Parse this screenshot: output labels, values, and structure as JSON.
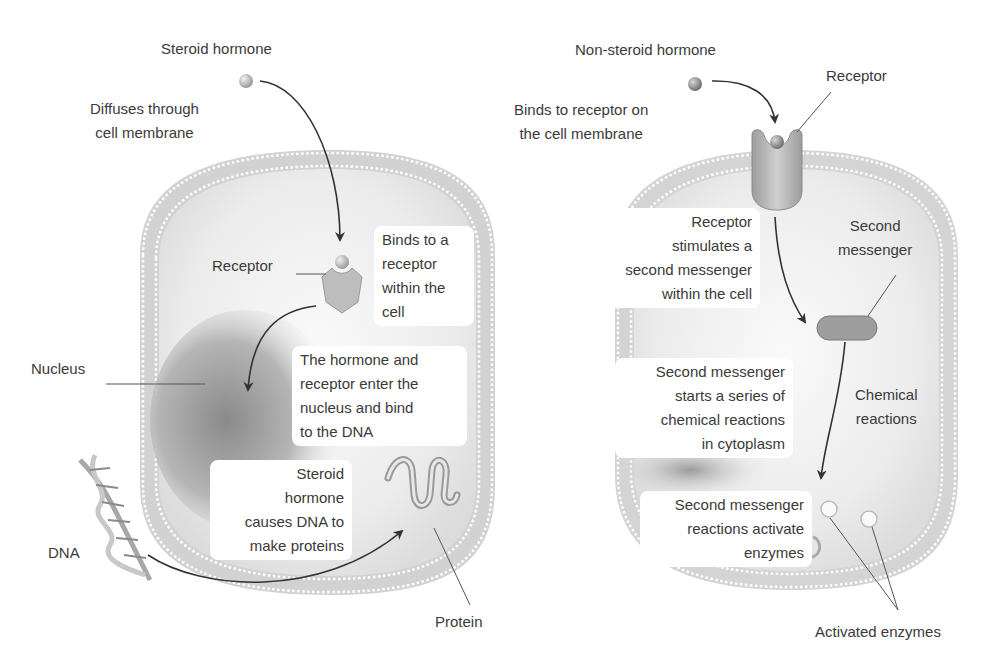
{
  "steroid_panel": {
    "title": "Steroid hormone",
    "step1": [
      "Diffuses through",
      "cell membrane"
    ],
    "receptor_label": "Receptor",
    "step2": [
      "Binds to a",
      "receptor",
      "within the",
      "cell"
    ],
    "nucleus_label": "Nucleus",
    "step3": [
      "The hormone and",
      "receptor enter the",
      "nucleus and bind",
      "to the DNA"
    ],
    "step4": [
      "Steroid",
      "hormone",
      "causes DNA to",
      "make proteins"
    ],
    "dna_label": "DNA",
    "protein_label": "Protein"
  },
  "nonsteroid_panel": {
    "title": "Non-steroid hormone",
    "receptor_label": "Receptor",
    "step1": [
      "Binds to receptor on",
      "the cell membrane"
    ],
    "step2": [
      "Receptor",
      "stimulates a",
      "second messenger",
      "within the cell"
    ],
    "second_messenger_label": [
      "Second",
      "messenger"
    ],
    "step3": [
      "Second messenger",
      "starts a series of",
      "chemical reactions",
      "in cytoplasm"
    ],
    "chemical_reactions_label": [
      "Chemical",
      "reactions"
    ],
    "step4": [
      "Second messenger",
      "reactions activate",
      "enzymes"
    ],
    "activated_enzymes_label": "Activated enzymes"
  },
  "colors": {
    "membrane": "#c8c8c8",
    "cytoplasm": "#ececec",
    "arrow": "#333333"
  }
}
